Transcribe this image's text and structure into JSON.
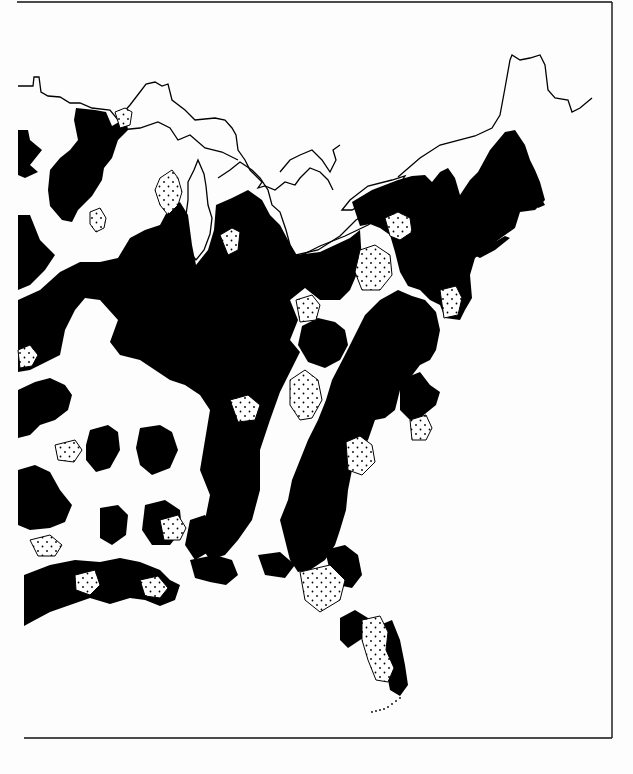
{
  "map": {
    "subject": "Eastern United States distribution map",
    "legend_visible": false,
    "colors": {
      "background": "#fdfdfd",
      "solid_region": "#000000",
      "stippled_region_fill": "#ffffff",
      "outline": "#000000"
    },
    "region_types": [
      {
        "name": "solid",
        "style": "black fill"
      },
      {
        "name": "stippled",
        "style": "dotted fill with outline"
      },
      {
        "name": "blank",
        "style": "white"
      }
    ],
    "frame": {
      "top": 2,
      "right": 612,
      "bottom": 738,
      "left": 17
    }
  }
}
